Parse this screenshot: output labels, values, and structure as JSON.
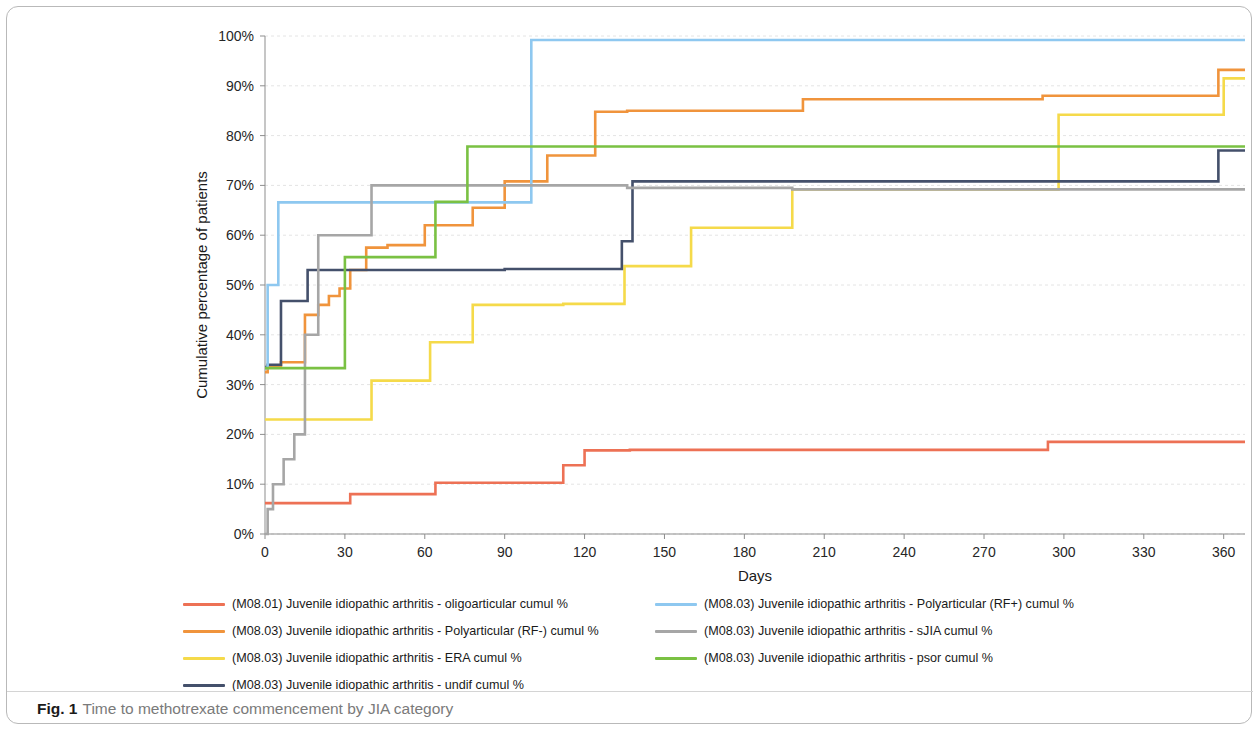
{
  "caption": {
    "label": "Fig. 1",
    "text": "Time to methotrexate commencement by JIA category"
  },
  "chart_data": {
    "type": "line",
    "subtype": "step",
    "title": "",
    "xlabel": "Days",
    "ylabel": "Cumulative percentage of patients",
    "xlim": [
      0,
      368
    ],
    "ylim": [
      0,
      100
    ],
    "xticks": [
      0,
      30,
      60,
      90,
      120,
      150,
      180,
      210,
      240,
      270,
      300,
      330,
      360
    ],
    "xtick_labels": [
      "0",
      "30",
      "60",
      "90",
      "120",
      "150",
      "180",
      "210",
      "240",
      "270",
      "300",
      "330",
      "360"
    ],
    "yticks": [
      0,
      10,
      20,
      30,
      40,
      50,
      60,
      70,
      80,
      90,
      100
    ],
    "ytick_labels": [
      "0%",
      "10%",
      "20%",
      "30%",
      "40%",
      "50%",
      "60%",
      "70%",
      "80%",
      "90%",
      "100%"
    ],
    "grid": "horizontal",
    "legend_position": "bottom",
    "series": [
      {
        "name": "(M08.01) Juvenile idiopathic arthritis - oligoarticular cumul %",
        "short_name": "oligoarticular",
        "color": "#ED7155",
        "x": [
          0,
          2,
          30,
          32,
          62,
          64,
          110,
          112,
          118,
          120,
          135,
          137,
          292,
          294,
          368
        ],
        "y": [
          6.2,
          6.2,
          6.2,
          8.0,
          8.0,
          10.3,
          10.3,
          13.8,
          13.8,
          16.8,
          16.8,
          16.9,
          16.9,
          18.5,
          18.5
        ]
      },
      {
        "name": "(M08.03) Juvenile idiopathic arthritis - Polyarticular (RF-) cumul %",
        "short_name": "Polyarticular (RF-)",
        "color": "#F0943C",
        "x": [
          0,
          1,
          4,
          6,
          13,
          15,
          18,
          20,
          22,
          24,
          26,
          28,
          30,
          32,
          36,
          38,
          44,
          46,
          58,
          60,
          76,
          78,
          88,
          90,
          104,
          106,
          122,
          124,
          134,
          136,
          200,
          202,
          290,
          292,
          356,
          358,
          368
        ],
        "y": [
          32.5,
          33.5,
          33.5,
          34.5,
          34.5,
          44.0,
          44.0,
          46.0,
          46.0,
          47.8,
          47.8,
          49.3,
          49.3,
          53.0,
          53.0,
          57.5,
          57.5,
          58.0,
          58.0,
          62.0,
          62.0,
          65.5,
          65.5,
          70.8,
          70.8,
          76.0,
          76.0,
          84.8,
          84.8,
          85.0,
          85.0,
          87.3,
          87.3,
          88.0,
          88.0,
          93.2,
          93.2
        ]
      },
      {
        "name": "(M08.03) Juvenile idiopathic arthritis - ERA cumul %",
        "short_name": "ERA",
        "color": "#F5DA4A",
        "x": [
          0,
          38,
          40,
          60,
          62,
          76,
          78,
          110,
          112,
          133,
          135,
          158,
          160,
          196,
          198,
          296,
          298,
          358,
          360,
          368
        ],
        "y": [
          23.0,
          23.0,
          30.8,
          30.8,
          38.5,
          38.5,
          46.0,
          46.0,
          46.2,
          46.2,
          53.8,
          53.8,
          61.5,
          61.5,
          69.2,
          69.2,
          84.2,
          84.2,
          91.5,
          91.5
        ]
      },
      {
        "name": "(M08.03) Juvenile idiopathic arthritis - undif cumul %",
        "short_name": "undif",
        "color": "#44506B",
        "x": [
          0,
          1,
          4,
          6,
          14,
          16,
          88,
          90,
          132,
          134,
          136,
          138,
          356,
          358,
          368
        ],
        "y": [
          33.5,
          34.0,
          34.0,
          46.8,
          46.8,
          53.0,
          53.0,
          53.2,
          53.2,
          58.8,
          58.8,
          70.8,
          70.8,
          77.0,
          77.0
        ]
      },
      {
        "name": "(M08.03) Juvenile idiopathic arthritis - Polyarticular (RF+) cumul %",
        "short_name": "Polyarticular (RF+)",
        "color": "#8EC8F0",
        "x": [
          0,
          1,
          3,
          5,
          98,
          100,
          368
        ],
        "y": [
          33.3,
          50.0,
          50.0,
          66.6,
          66.6,
          99.2,
          99.2
        ]
      },
      {
        "name": "(M08.03) Juvenile idiopathic arthritis - sJIA cumul %",
        "short_name": "sJIA",
        "color": "#A6A6A6",
        "x": [
          0,
          1,
          2,
          3,
          5,
          7,
          9,
          11,
          13,
          15,
          18,
          20,
          38,
          40,
          134,
          136,
          196,
          198,
          368
        ],
        "y": [
          0.0,
          5.0,
          5.0,
          10.0,
          10.0,
          15.0,
          15.0,
          20.0,
          20.0,
          40.0,
          40.0,
          60.0,
          60.0,
          70.0,
          70.0,
          69.5,
          69.5,
          69.2,
          69.2
        ]
      },
      {
        "name": "(M08.03) Juvenile idiopathic arthritis - psor cumul %",
        "short_name": "psor",
        "color": "#7AC143",
        "x": [
          0,
          1,
          28,
          30,
          38,
          40,
          62,
          64,
          74,
          76,
          368
        ],
        "y": [
          33.3,
          33.3,
          33.3,
          55.6,
          55.6,
          55.6,
          55.6,
          66.7,
          66.7,
          77.8,
          77.8
        ]
      }
    ]
  },
  "legend": {
    "left_items": [
      {
        "label": "(M08.01) Juvenile idiopathic arthritis - oligoarticular cumul %",
        "color": "#ED7155"
      },
      {
        "label": "(M08.03) Juvenile idiopathic arthritis - Polyarticular (RF-) cumul %",
        "color": "#F0943C"
      },
      {
        "label": "(M08.03) Juvenile idiopathic arthritis - ERA cumul %",
        "color": "#F5DA4A"
      },
      {
        "label": "(M08.03) Juvenile idiopathic arthritis - undif cumul %",
        "color": "#44506B"
      }
    ],
    "right_items": [
      {
        "label": "(M08.03) Juvenile idiopathic arthritis - Polyarticular (RF+) cumul %",
        "color": "#8EC8F0"
      },
      {
        "label": "(M08.03) Juvenile idiopathic arthritis - sJIA cumul %",
        "color": "#A6A6A6"
      },
      {
        "label": "(M08.03) Juvenile idiopathic arthritis - psor cumul %",
        "color": "#7AC143"
      }
    ]
  }
}
